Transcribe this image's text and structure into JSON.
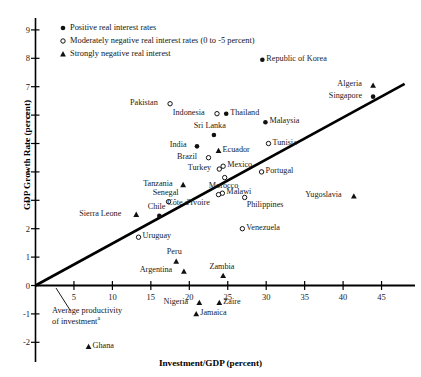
{
  "chart_data": {
    "type": "scatter",
    "title": "",
    "xlabel": "Investment/GDP (percent)",
    "ylabel": "GDP Growth Rate (percent)",
    "xlim": [
      0,
      48
    ],
    "ylim": [
      -2.6,
      9.6
    ],
    "xticks": [
      5,
      10,
      15,
      20,
      25,
      30,
      35,
      40,
      45
    ],
    "yticks": [
      -2,
      -1,
      0,
      1,
      2,
      3,
      4,
      5,
      6,
      7,
      8,
      9
    ],
    "grid": false,
    "legend_position": "top-left-inside",
    "legend": [
      {
        "marker": "filled-circle",
        "label": "Positive real interest rates"
      },
      {
        "marker": "open-circle",
        "label": "Moderately negative real interest rates (0 to -5 percent)"
      },
      {
        "marker": "triangle",
        "label": "Strongly negative real interest"
      }
    ],
    "annotations": [
      {
        "text": "Average productivity of investment",
        "superscript": "a",
        "kind": "trendline-label"
      }
    ],
    "trendline": {
      "label": "Average productivity of investment",
      "x0": 0.0,
      "y0": 0.0,
      "x1": 48.0,
      "y1": 7.1
    },
    "points": [
      {
        "name": "Republic of Korea",
        "x": 29.5,
        "y": 7.95,
        "marker": "filled-circle",
        "label_side": "right"
      },
      {
        "name": "Algeria",
        "x": 43.9,
        "y": 7.05,
        "marker": "triangle",
        "label_side": "left"
      },
      {
        "name": "Singapore",
        "x": 43.9,
        "y": 6.65,
        "marker": "filled-circle",
        "label_side": "left"
      },
      {
        "name": "Pakistan",
        "x": 17.5,
        "y": 6.4,
        "marker": "open-circle",
        "label_side": "left"
      },
      {
        "name": "Indonesia",
        "x": 23.6,
        "y": 6.05,
        "marker": "open-circle",
        "label_side": "left"
      },
      {
        "name": "Thailand",
        "x": 24.8,
        "y": 6.05,
        "marker": "filled-circle",
        "label_side": "right"
      },
      {
        "name": "Malaysia",
        "x": 29.9,
        "y": 5.75,
        "marker": "filled-circle",
        "label_side": "right"
      },
      {
        "name": "Sri Lanka",
        "x": 23.2,
        "y": 5.3,
        "marker": "filled-circle",
        "label_side": "above"
      },
      {
        "name": "India",
        "x": 21.0,
        "y": 4.9,
        "marker": "filled-circle",
        "label_side": "left"
      },
      {
        "name": "Ecuador",
        "x": 23.8,
        "y": 4.75,
        "marker": "triangle",
        "label_side": "right"
      },
      {
        "name": "Tunisia",
        "x": 30.3,
        "y": 5.0,
        "marker": "open-circle",
        "label_side": "right"
      },
      {
        "name": "Brazil",
        "x": 22.5,
        "y": 4.5,
        "marker": "open-circle",
        "label_side": "left"
      },
      {
        "name": "Mexico",
        "x": 24.4,
        "y": 4.2,
        "marker": "open-circle",
        "label_side": "right"
      },
      {
        "name": "Turkey",
        "x": 23.9,
        "y": 4.1,
        "marker": "open-circle",
        "label_side": "left"
      },
      {
        "name": "Morocco",
        "x": 24.6,
        "y": 3.8,
        "marker": "open-circle",
        "label_side": "below"
      },
      {
        "name": "Portugal",
        "x": 29.4,
        "y": 4.0,
        "marker": "open-circle",
        "label_side": "right"
      },
      {
        "name": "Tanzania",
        "x": 19.2,
        "y": 3.55,
        "marker": "triangle",
        "label_side": "left"
      },
      {
        "name": "Senegal",
        "x": 17.3,
        "y": 2.95,
        "marker": "open-circle",
        "label_side": "above"
      },
      {
        "name": "Malawi",
        "x": 24.3,
        "y": 3.25,
        "marker": "open-circle",
        "label_side": "right"
      },
      {
        "name": "Philippines",
        "x": 27.2,
        "y": 3.1,
        "marker": "open-circle",
        "label_side": "below-right"
      },
      {
        "name": "Yugoslavia",
        "x": 41.4,
        "y": 3.15,
        "marker": "triangle",
        "label_side": "left"
      },
      {
        "name": "Côte d'Ivoire",
        "x": 23.8,
        "y": 3.2,
        "marker": "open-circle",
        "label_side": "below-left"
      },
      {
        "name": "Chile",
        "x": 16.1,
        "y": 2.45,
        "marker": "filled-circle",
        "label_side": "above"
      },
      {
        "name": "Sierra Leone",
        "x": 13.1,
        "y": 2.5,
        "marker": "triangle",
        "label_side": "left"
      },
      {
        "name": "Venezuela",
        "x": 26.9,
        "y": 2.0,
        "marker": "open-circle",
        "label_side": "right"
      },
      {
        "name": "Uruguay",
        "x": 13.4,
        "y": 1.7,
        "marker": "open-circle",
        "label_side": "right"
      },
      {
        "name": "Peru",
        "x": 18.3,
        "y": 0.85,
        "marker": "triangle",
        "label_side": "above"
      },
      {
        "name": "Argentina",
        "x": 19.3,
        "y": 0.5,
        "marker": "triangle",
        "label_side": "left"
      },
      {
        "name": "Zambia",
        "x": 24.4,
        "y": 0.35,
        "marker": "triangle",
        "label_side": "above"
      },
      {
        "name": "Nigeria",
        "x": 21.3,
        "y": -0.6,
        "marker": "triangle",
        "label_side": "left"
      },
      {
        "name": "Zaire",
        "x": 23.9,
        "y": -0.6,
        "marker": "triangle",
        "label_side": "right"
      },
      {
        "name": "Jamaica",
        "x": 20.9,
        "y": -1.0,
        "marker": "triangle",
        "label_side": "right"
      },
      {
        "name": "Ghana",
        "x": 6.9,
        "y": -2.15,
        "marker": "triangle",
        "label_side": "right"
      }
    ]
  },
  "axis": {
    "x_title": "Investment/GDP (percent)",
    "y_title": "GDP Growth Rate (percent)",
    "x_tick_labels": [
      "5",
      "10",
      "15",
      "20",
      "25",
      "30",
      "35",
      "40",
      "45"
    ],
    "y_tick_labels": [
      "9",
      "8",
      "7",
      "6",
      "5",
      "4",
      "3",
      "2",
      "1",
      "0",
      "-1",
      "-2"
    ]
  },
  "legend": {
    "items": [
      {
        "label": "Positive real interest rates",
        "marker": "filled-circle"
      },
      {
        "label": "Moderately negative real interest rates (0 to -5 percent)",
        "marker": "open-circle"
      },
      {
        "label": "Strongly negative real interest",
        "marker": "triangle"
      }
    ]
  },
  "trendline_note": {
    "line1": "Average productivity",
    "line2": "of investment",
    "superscript": "a"
  },
  "colors": {
    "axis": "#000000",
    "marker": "#111111",
    "text": "#141414",
    "background": "#ffffff"
  }
}
